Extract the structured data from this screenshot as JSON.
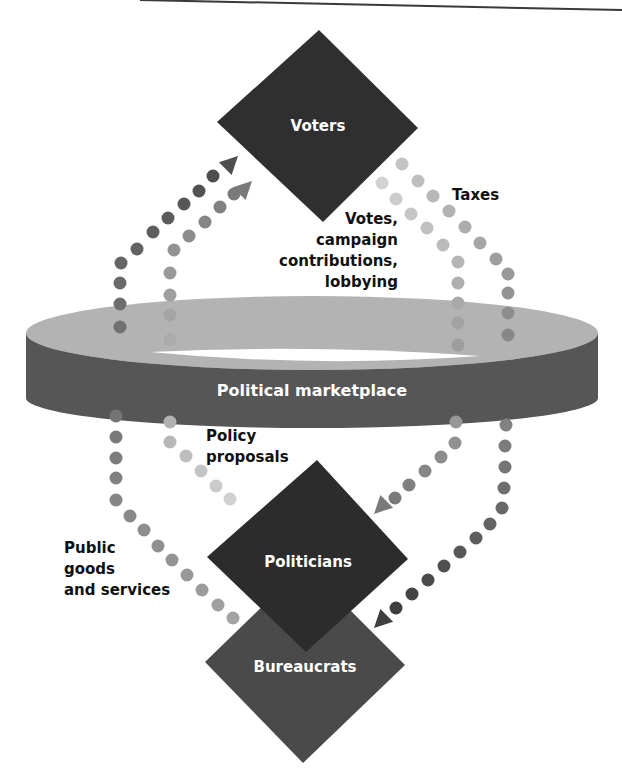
{
  "colors": {
    "voters": "#2f2f2f",
    "politicians": "#2c2c2c",
    "bureaucrats": "#4a4a4a",
    "ring_top": "#b3b3b3",
    "ring_band": "#565656",
    "rule_line": "#3a3a3a",
    "dot_dark": "#5e5e5e",
    "dot_mid": "#7d7d7d",
    "dot_light": "#a9a9a9",
    "dot_pale": "#c9c9c9"
  },
  "nodes": {
    "voters": {
      "label": "Voters"
    },
    "politicians": {
      "label": "Politicians"
    },
    "bureaucrats": {
      "label": "Bureaucrats"
    }
  },
  "marketplace": {
    "label": "Political marketplace"
  },
  "flows": {
    "public_goods": {
      "label_lines": [
        "Public",
        "goods",
        "and services"
      ]
    },
    "votes": {
      "label_lines": [
        "Votes,",
        "campaign",
        "contributions,",
        "lobbying"
      ]
    },
    "taxes": {
      "label_lines": [
        "Taxes"
      ]
    },
    "policy": {
      "label_lines": [
        "Policy",
        "proposals"
      ]
    }
  },
  "paths": [
    {
      "name": "public-goods-flow",
      "direction": "Bureaucrats to Voters",
      "color_from": "#a4a4a4",
      "color_to": "#4e4e4e",
      "dots": [
        [
          233,
          618
        ],
        [
          218,
          605
        ],
        [
          202,
          590
        ],
        [
          187,
          575
        ],
        [
          172,
          560
        ],
        [
          158,
          546
        ],
        [
          144,
          530
        ],
        [
          130,
          516
        ],
        [
          116,
          500
        ],
        [
          116,
          478
        ],
        [
          116,
          458
        ],
        [
          116,
          437
        ],
        [
          116,
          416
        ],
        [
          120,
          327
        ],
        [
          120,
          304
        ],
        [
          120,
          283
        ],
        [
          121,
          263
        ],
        [
          137,
          249
        ],
        [
          153,
          232
        ],
        [
          168,
          218
        ],
        [
          184,
          204
        ],
        [
          199,
          191
        ],
        [
          213,
          176
        ]
      ],
      "arrow": {
        "tip": [
          238,
          156
        ],
        "angle": -45
      }
    },
    {
      "name": "policy-proposals-flow",
      "direction": "Politicians to Voters",
      "color_from": "#d0d0d0",
      "color_to": "#7a7a7a",
      "dots": [
        [
          230,
          499
        ],
        [
          216,
          486
        ],
        [
          201,
          471
        ],
        [
          186,
          456
        ],
        [
          170,
          442
        ],
        [
          170,
          422
        ],
        [
          170,
          340
        ],
        [
          170,
          315
        ],
        [
          170,
          295
        ],
        [
          170,
          273
        ],
        [
          174,
          250
        ],
        [
          189,
          236
        ],
        [
          205,
          222
        ],
        [
          220,
          207
        ],
        [
          234,
          194
        ]
      ],
      "arrow": {
        "tip": [
          252,
          181
        ],
        "angle": -45
      }
    },
    {
      "name": "votes-flow",
      "direction": "Voters to Politicians",
      "color_from": "#d2d2d2",
      "color_to": "#7a7a7a",
      "dots": [
        [
          382,
          183
        ],
        [
          396,
          199
        ],
        [
          411,
          214
        ],
        [
          427,
          228
        ],
        [
          443,
          245
        ],
        [
          458,
          262
        ],
        [
          458,
          283
        ],
        [
          458,
          303
        ],
        [
          458,
          323
        ],
        [
          458,
          345
        ],
        [
          456,
          422
        ],
        [
          455,
          443
        ],
        [
          441,
          457
        ],
        [
          425,
          471
        ],
        [
          409,
          485
        ],
        [
          395,
          498
        ]
      ],
      "arrow": {
        "tip": [
          374,
          514
        ],
        "angle": 135
      }
    },
    {
      "name": "taxes-flow",
      "direction": "Voters to Bureaucrats",
      "color_from": "#c4c4c4",
      "color_to": "#3e3e3e",
      "dots": [
        [
          402,
          164
        ],
        [
          418,
          181
        ],
        [
          433,
          196
        ],
        [
          449,
          211
        ],
        [
          465,
          227
        ],
        [
          480,
          243
        ],
        [
          496,
          259
        ],
        [
          508,
          274
        ],
        [
          508,
          293
        ],
        [
          508,
          313
        ],
        [
          508,
          335
        ],
        [
          506,
          425
        ],
        [
          505,
          446
        ],
        [
          505,
          467
        ],
        [
          504,
          488
        ],
        [
          502,
          508
        ],
        [
          490,
          524
        ],
        [
          476,
          538
        ],
        [
          460,
          552
        ],
        [
          444,
          566
        ],
        [
          428,
          580
        ],
        [
          412,
          594
        ],
        [
          396,
          608
        ]
      ],
      "arrow": {
        "tip": [
          374,
          628
        ],
        "angle": 135
      }
    }
  ]
}
